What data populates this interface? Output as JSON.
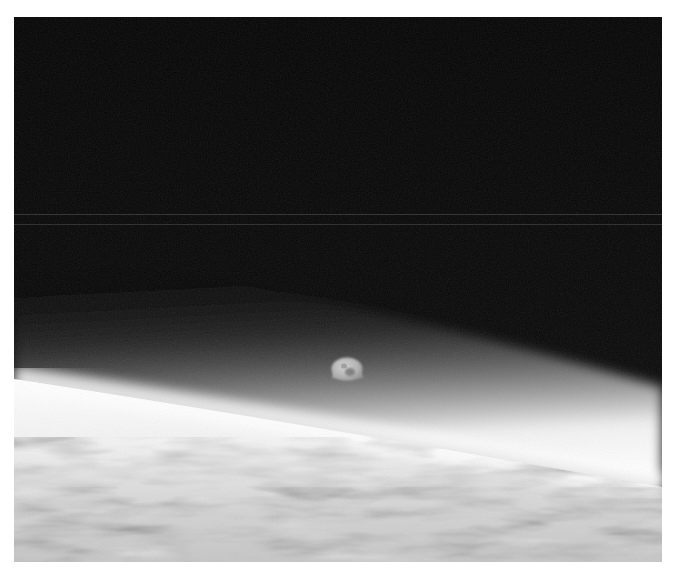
{
  "image": {
    "subject": "Moon rising above Earth's horizon seen from orbit",
    "style": "black-and-white photograph",
    "frame": {
      "x": 14,
      "y": 17,
      "width": 648,
      "height": 545
    },
    "colors": {
      "page_background": "#ffffff",
      "space": "#050505",
      "atmosphere_glow": "#f4f4f4",
      "clouds": "#c8c8c8",
      "moon_lit": "#bdbdbd",
      "moon_dark": "#5a5a5a",
      "scan_line": "#2a2a2a"
    },
    "elements": [
      {
        "name": "space-background",
        "description": "dark black sky"
      },
      {
        "name": "scan-lines",
        "description": "two faint horizontal lines",
        "y": [
          214,
          224
        ]
      },
      {
        "name": "moon",
        "description": "gibbous moon partly lit",
        "cx": 347,
        "cy": 368,
        "r": 15
      },
      {
        "name": "earth-limb",
        "description": "bright curved horizon with atmospheric glow, sloping down left to right"
      },
      {
        "name": "earth-clouds",
        "description": "mottled gray cloud cover along bottom"
      }
    ]
  }
}
